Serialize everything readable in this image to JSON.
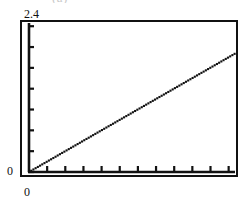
{
  "figure": {
    "caption_fragment": "(a)",
    "background_color": "#ffffff",
    "foreground_color": "#111111"
  },
  "axes": {
    "y_max_label": "2.4",
    "y_min_label": "0",
    "x_min_label": "0"
  },
  "chart_data": {
    "type": "line",
    "title": "",
    "subtitle": "",
    "xlabel": "",
    "ylabel": "",
    "xlim": [
      0,
      11
    ],
    "ylim": [
      0,
      2.4
    ],
    "grid": false,
    "legend": null,
    "legend_position": "none",
    "x_tick_labels": [
      "0"
    ],
    "y_tick_labels": [
      "0",
      "2.4"
    ],
    "x_tick_count": 11,
    "y_tick_count": 8,
    "tick_direction": "in",
    "line_style": "dotted",
    "marker": "square",
    "marker_color": "#111111",
    "series": [
      {
        "name": "linear",
        "x": [
          0.0,
          0.25,
          0.5,
          0.75,
          1.0,
          1.25,
          1.5,
          1.75,
          2.0,
          2.25,
          2.5,
          2.75,
          3.0,
          3.25,
          3.5,
          3.75,
          4.0,
          4.25,
          4.5,
          4.75,
          5.0,
          5.25,
          5.5,
          5.75,
          6.0,
          6.25,
          6.5,
          6.75,
          7.0,
          7.25,
          7.5,
          7.75,
          8.0,
          8.25,
          8.5,
          8.75,
          9.0,
          9.25,
          9.5,
          9.75,
          10.0,
          10.25,
          10.5,
          10.75,
          11.0
        ],
        "y": [
          0.0,
          0.044,
          0.087,
          0.131,
          0.175,
          0.218,
          0.262,
          0.306,
          0.349,
          0.393,
          0.436,
          0.48,
          0.524,
          0.567,
          0.611,
          0.655,
          0.698,
          0.742,
          0.785,
          0.829,
          0.873,
          0.916,
          0.96,
          1.004,
          1.047,
          1.091,
          1.135,
          1.178,
          1.222,
          1.265,
          1.309,
          1.353,
          1.396,
          1.44,
          1.484,
          1.527,
          1.571,
          1.615,
          1.658,
          1.702,
          1.745,
          1.789,
          1.833,
          1.876,
          1.92
        ]
      }
    ]
  }
}
